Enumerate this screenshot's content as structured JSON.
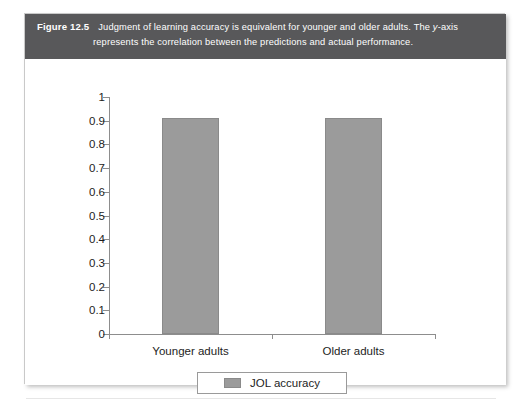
{
  "figure": {
    "label": "Figure 12.5",
    "caption_line1": "Judgment of learning accuracy is equivalent for younger and older adults. The ",
    "caption_italic": "y",
    "caption_line1_tail": "-axis",
    "caption_line2": "represents the correlation between the predictions and actual performance.",
    "header_color": "#58585a"
  },
  "chart_data": {
    "type": "bar",
    "title": "",
    "categories": [
      "Younger adults",
      "Older adults"
    ],
    "series": [
      {
        "name": "JOL accuracy",
        "values": [
          0.91,
          0.91
        ]
      }
    ],
    "values": [
      0.91,
      0.91
    ],
    "xlabel": "",
    "ylabel": "",
    "ylim": [
      0,
      1
    ],
    "ytick_values": [
      1,
      0.9,
      0.8,
      0.7,
      0.6,
      0.5,
      0.4,
      0.3,
      0.2,
      0.1,
      0
    ],
    "ytick_labels": [
      "1",
      "0.9",
      "0.8",
      "0.7",
      "0.6",
      "0.5",
      "0.4",
      "0.3",
      "0.2",
      "0.1",
      "0"
    ],
    "grid": false,
    "legend": {
      "position": "bottom",
      "entries": [
        "JOL accuracy"
      ]
    },
    "bar_color": "#9b9b9b",
    "axis_color": "#8d8d8d"
  }
}
